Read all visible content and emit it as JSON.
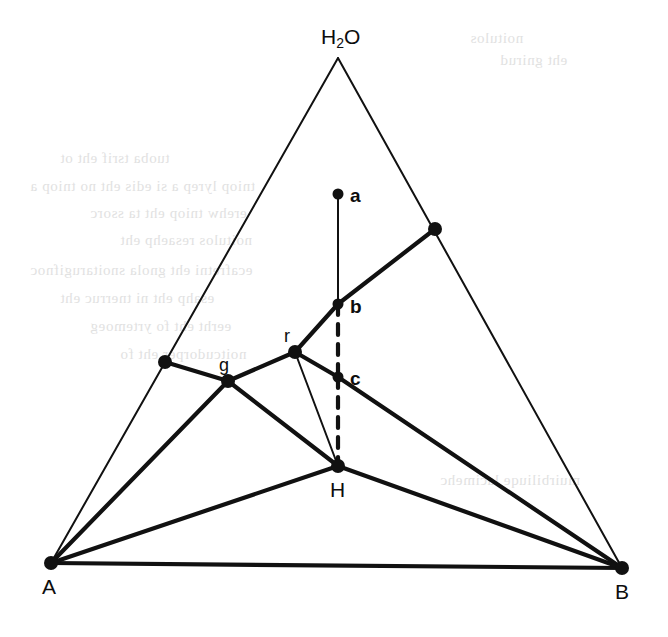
{
  "figure": {
    "name": "ternary-phase-diagram",
    "caption": "",
    "background_color": "#ffffff",
    "line_color": "#111111",
    "node_color": "#111111"
  },
  "labels": {
    "apex": "H",
    "apex_sub": "2",
    "apex_tail": "O",
    "apex_full": "H2O",
    "left_corner": "A",
    "right_corner": "B",
    "point_a": "a",
    "point_b": "b",
    "point_c": "c",
    "point_r": "r",
    "point_g": "g",
    "point_h": "H"
  },
  "chart_data": {
    "type": "scatter",
    "xlabel": "",
    "ylabel": "",
    "grid": false,
    "legend": "none",
    "xlim": [
      0,
      668
    ],
    "ylim": [
      637,
      0
    ],
    "corners": [
      {
        "id": "H2O",
        "label": "H2O",
        "x": 338,
        "y": 58
      },
      {
        "id": "A",
        "label": "A",
        "x": 51,
        "y": 563
      },
      {
        "id": "B",
        "label": "B",
        "x": 622,
        "y": 568
      }
    ],
    "points": [
      {
        "id": "a",
        "label": "a",
        "x": 338,
        "y": 194,
        "label_dx": 14,
        "label_dy": 0
      },
      {
        "id": "b",
        "label": "b",
        "x": 338,
        "y": 304,
        "label_dx": 14,
        "label_dy": 2
      },
      {
        "id": "c",
        "label": "c",
        "x": 338,
        "y": 377,
        "label_dx": 14,
        "label_dy": 1
      },
      {
        "id": "r",
        "label": "r",
        "x": 295,
        "y": 352,
        "label_dx": -7,
        "label_dy": -17
      },
      {
        "id": "g",
        "label": "g",
        "x": 228,
        "y": 381,
        "label_dx": -4,
        "label_dy": -17
      },
      {
        "id": "H",
        "label": "H",
        "x": 338,
        "y": 466,
        "label_dx": -1,
        "label_dy": 26
      },
      {
        "id": "n-left",
        "label": "",
        "x": 165,
        "y": 362,
        "label_dx": 0,
        "label_dy": 0
      },
      {
        "id": "n-right",
        "label": "",
        "x": 435,
        "y": 229,
        "label_dx": 0,
        "label_dy": 0
      }
    ],
    "edges": [
      {
        "from": "H2O",
        "to": "A",
        "style": "solid",
        "weight": "thin",
        "kind": "triangle-side"
      },
      {
        "from": "H2O",
        "to": "B",
        "style": "solid",
        "weight": "thin",
        "kind": "triangle-side"
      },
      {
        "from": "A",
        "to": "B",
        "style": "solid",
        "weight": "thick",
        "kind": "triangle-base"
      },
      {
        "from": "a",
        "to": "b",
        "style": "solid",
        "weight": "thin",
        "kind": "tie-line"
      },
      {
        "from": "b",
        "to": "c",
        "style": "dashed",
        "weight": "thick",
        "kind": "tie-line"
      },
      {
        "from": "c",
        "to": "H",
        "style": "dashed",
        "weight": "thick",
        "kind": "tie-line"
      },
      {
        "from": "n-left",
        "to": "g",
        "style": "solid",
        "weight": "thick",
        "kind": "binodal"
      },
      {
        "from": "g",
        "to": "r",
        "style": "solid",
        "weight": "thick",
        "kind": "binodal"
      },
      {
        "from": "r",
        "to": "b",
        "style": "solid",
        "weight": "thick",
        "kind": "binodal"
      },
      {
        "from": "b",
        "to": "n-right",
        "style": "solid",
        "weight": "thick",
        "kind": "binodal"
      },
      {
        "from": "r",
        "to": "c",
        "style": "solid",
        "weight": "thick",
        "kind": "binodal"
      },
      {
        "from": "c",
        "to": "B",
        "style": "solid",
        "weight": "thick",
        "kind": "binodal"
      },
      {
        "from": "r",
        "to": "H",
        "style": "solid",
        "weight": "thin",
        "kind": "tie-line"
      },
      {
        "from": "g",
        "to": "H",
        "style": "solid",
        "weight": "thick",
        "kind": "tie-line"
      },
      {
        "from": "g",
        "to": "A",
        "style": "solid",
        "weight": "thick",
        "kind": "tie-line"
      },
      {
        "from": "A",
        "to": "H",
        "style": "solid",
        "weight": "thick",
        "kind": "tie-line"
      },
      {
        "from": "H",
        "to": "B",
        "style": "solid",
        "weight": "thick",
        "kind": "tie-line"
      }
    ]
  },
  "background_bleed": [
    {
      "text": "noitulos",
      "x": 470,
      "y": 30
    },
    {
      "text": "eht gnirud",
      "x": 500,
      "y": 52
    },
    {
      "text": "tuoba tsrif eht ot",
      "x": 60,
      "y": 150
    },
    {
      "text": "tniop lyrep a si edis eht no tniop a",
      "x": 30,
      "y": 178
    },
    {
      "text": "erehw tniop eht ta ssorc",
      "x": 90,
      "y": 205
    },
    {
      "text": "noitulos resaehp eht",
      "x": 120,
      "y": 232
    },
    {
      "text": "ecafretni eht gnola snoitarugifnoc",
      "x": 30,
      "y": 262
    },
    {
      "text": "esahp eht ni tnerruc eht",
      "x": 60,
      "y": 290
    },
    {
      "text": "eerht eht fo yrtemoeg",
      "x": 90,
      "y": 318
    },
    {
      "text": "noitcudorper eht fo",
      "x": 120,
      "y": 346
    },
    {
      "text": "muirbiliuqe lacimehc",
      "x": 440,
      "y": 472
    }
  ]
}
